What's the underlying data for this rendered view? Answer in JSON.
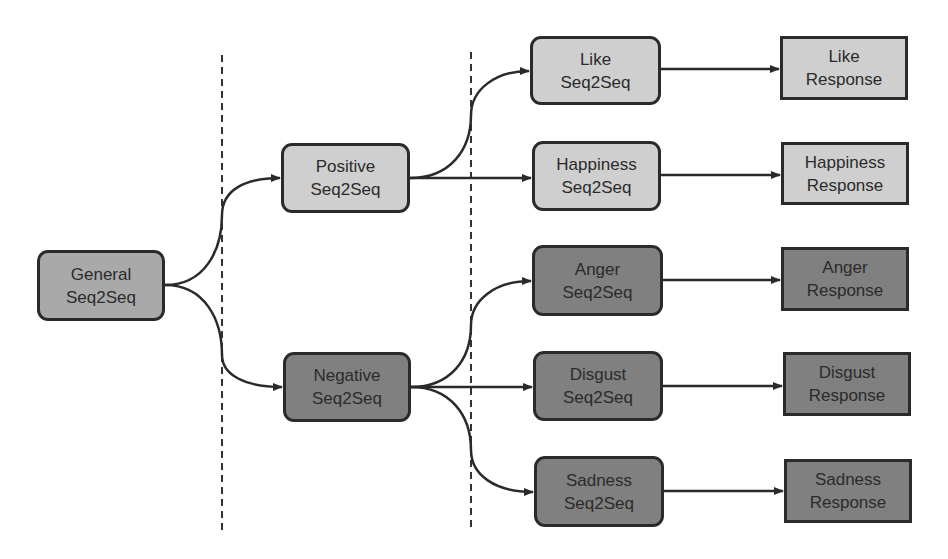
{
  "diagram": {
    "colors": {
      "light_fill": "#cfcfcf",
      "mid_fill": "#a9a9a9",
      "dark_fill": "#808080",
      "border": "#2a2a2a",
      "edge": "#2a2a2a",
      "background": "#ffffff"
    },
    "nodes": {
      "general": {
        "line1": "General",
        "line2": "Seq2Seq",
        "tone": "mid"
      },
      "positive": {
        "line1": "Positive",
        "line2": "Seq2Seq",
        "tone": "light"
      },
      "negative": {
        "line1": "Negative",
        "line2": "Seq2Seq",
        "tone": "dark"
      },
      "like": {
        "line1": "Like",
        "line2": "Seq2Seq",
        "tone": "light"
      },
      "happiness": {
        "line1": "Happiness",
        "line2": "Seq2Seq",
        "tone": "light"
      },
      "anger": {
        "line1": "Anger",
        "line2": "Seq2Seq",
        "tone": "dark"
      },
      "disgust": {
        "line1": "Disgust",
        "line2": "Seq2Seq",
        "tone": "dark"
      },
      "sadness": {
        "line1": "Sadness",
        "line2": "Seq2Seq",
        "tone": "dark"
      },
      "like_response": {
        "line1": "Like",
        "line2": "Response",
        "tone": "light"
      },
      "happiness_response": {
        "line1": "Happiness",
        "line2": "Response",
        "tone": "light"
      },
      "anger_response": {
        "line1": "Anger",
        "line2": "Response",
        "tone": "dark"
      },
      "disgust_response": {
        "line1": "Disgust",
        "line2": "Response",
        "tone": "dark"
      },
      "sadness_response": {
        "line1": "Sadness",
        "line2": "Response",
        "tone": "dark"
      }
    },
    "edges": [
      {
        "from": "general",
        "to": "positive"
      },
      {
        "from": "general",
        "to": "negative"
      },
      {
        "from": "positive",
        "to": "like"
      },
      {
        "from": "positive",
        "to": "happiness"
      },
      {
        "from": "negative",
        "to": "anger"
      },
      {
        "from": "negative",
        "to": "disgust"
      },
      {
        "from": "negative",
        "to": "sadness"
      },
      {
        "from": "like",
        "to": "like_response"
      },
      {
        "from": "happiness",
        "to": "happiness_response"
      },
      {
        "from": "anger",
        "to": "anger_response"
      },
      {
        "from": "disgust",
        "to": "disgust_response"
      },
      {
        "from": "sadness",
        "to": "sadness_response"
      }
    ],
    "separators": [
      {
        "style": "dashed",
        "position": "between general and sentiment stage"
      },
      {
        "style": "dashed",
        "position": "between sentiment and emotion stage"
      }
    ]
  }
}
